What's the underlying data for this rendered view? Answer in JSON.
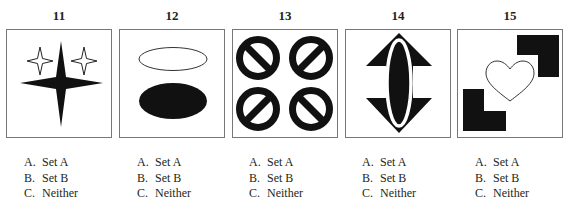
{
  "questions": [
    {
      "number": "11",
      "figure": "four-point-stars",
      "options": [
        {
          "letter": "A.",
          "label": "Set A"
        },
        {
          "letter": "B.",
          "label": "Set B"
        },
        {
          "letter": "C.",
          "label": "Neither"
        }
      ]
    },
    {
      "number": "12",
      "figure": "ellipses-outline-and-filled",
      "options": [
        {
          "letter": "A.",
          "label": "Set A"
        },
        {
          "letter": "B.",
          "label": "Set B"
        },
        {
          "letter": "C.",
          "label": "Neither"
        }
      ]
    },
    {
      "number": "13",
      "figure": "four-prohibition-circles",
      "options": [
        {
          "letter": "A.",
          "label": "Set A"
        },
        {
          "letter": "B.",
          "label": "Set B"
        },
        {
          "letter": "C.",
          "label": "Neither"
        }
      ]
    },
    {
      "number": "14",
      "figure": "double-arrow-with-ellipse",
      "options": [
        {
          "letter": "A.",
          "label": "Set A"
        },
        {
          "letter": "B.",
          "label": "Set B"
        },
        {
          "letter": "C.",
          "label": "Neither"
        }
      ]
    },
    {
      "number": "15",
      "figure": "heart-with-l-shapes",
      "options": [
        {
          "letter": "A.",
          "label": "Set A"
        },
        {
          "letter": "B.",
          "label": "Set B"
        },
        {
          "letter": "C.",
          "label": "Neither"
        }
      ]
    }
  ],
  "colors": {
    "ink": "#111111",
    "border": "#777777",
    "text": "#231f20"
  }
}
